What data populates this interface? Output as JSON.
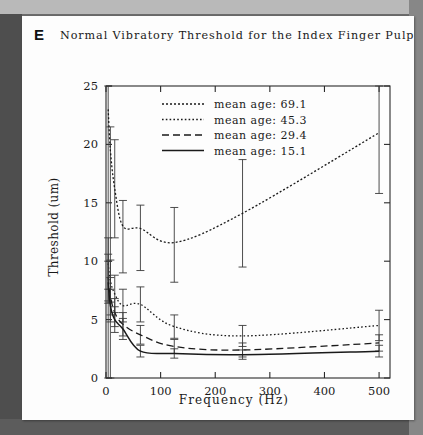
{
  "figure": {
    "panel_label": "E",
    "title": "Normal Vibratory Threshold for the Index Finger Pulp"
  },
  "chart_data": {
    "type": "line",
    "title": "Normal Vibratory Threshold for the Index Finger Pulp",
    "xlabel": "Frequency (Hz)",
    "ylabel": "Threshold (um)",
    "xlim": [
      0,
      520
    ],
    "ylim": [
      0,
      25
    ],
    "xticks": [
      0,
      100,
      200,
      300,
      400,
      500
    ],
    "yticks": [
      0,
      5,
      10,
      15,
      20,
      25
    ],
    "grid": false,
    "legend_position": "top-center-inside",
    "error_bars": true,
    "series": [
      {
        "name": "mean age: 69.1",
        "label": "mean age: 69.1",
        "linestyle": "dotted-coarse",
        "x": [
          4,
          8,
          16,
          31,
          63,
          125,
          250,
          500
        ],
        "y": [
          23.0,
          19.5,
          16.2,
          13.0,
          12.8,
          11.6,
          14.1,
          21.0
        ],
        "yerr_low": [
          23.0,
          19.5,
          4.2,
          4.0,
          3.6,
          3.4,
          4.6,
          5.2
        ],
        "yerr_high": [
          2.0,
          2.0,
          4.2,
          2.2,
          2.0,
          3.0,
          4.6,
          4.0
        ]
      },
      {
        "name": "mean age: 45.3",
        "label": "mean age: 45.3",
        "linestyle": "dotted-fine",
        "x": [
          4,
          8,
          16,
          31,
          63,
          125,
          250,
          500
        ],
        "y": [
          9.8,
          8.3,
          7.2,
          6.2,
          6.3,
          4.4,
          3.6,
          4.5
        ],
        "yerr_low": [
          2.2,
          1.8,
          1.6,
          1.4,
          1.5,
          1.0,
          0.9,
          1.3
        ],
        "yerr_high": [
          2.2,
          1.8,
          1.6,
          1.4,
          1.5,
          1.0,
          0.9,
          1.3
        ]
      },
      {
        "name": "mean age: 29.4",
        "label": "mean age: 29.4",
        "linestyle": "dashed",
        "x": [
          4,
          8,
          16,
          31,
          63,
          125,
          250,
          500
        ],
        "y": [
          8.6,
          7.0,
          5.6,
          4.6,
          3.7,
          2.7,
          2.4,
          3.0
        ],
        "yerr_low": [
          2.0,
          1.6,
          1.2,
          1.0,
          0.8,
          0.6,
          0.6,
          0.7
        ],
        "yerr_high": [
          2.0,
          1.6,
          1.2,
          1.0,
          0.8,
          0.6,
          0.6,
          0.7
        ]
      },
      {
        "name": "mean age: 15.1",
        "label": "mean age: 15.1",
        "linestyle": "solid",
        "x": [
          4,
          8,
          16,
          31,
          63,
          125,
          250,
          500
        ],
        "y": [
          8.2,
          6.2,
          5.0,
          4.2,
          2.3,
          2.1,
          2.0,
          2.3
        ],
        "yerr_low": [
          1.8,
          1.4,
          1.1,
          0.9,
          0.5,
          0.4,
          0.4,
          0.5
        ],
        "yerr_high": [
          1.8,
          1.4,
          1.1,
          0.9,
          0.5,
          0.4,
          0.4,
          0.5
        ]
      }
    ]
  }
}
